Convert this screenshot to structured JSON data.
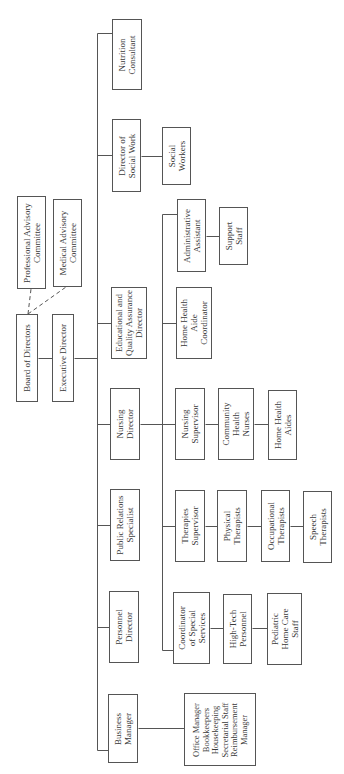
{
  "chart": {
    "orientation": "rotated-90-ccw",
    "nodes": [
      {
        "id": "professional",
        "label": "Professional Advisory\nCommittee",
        "x": 17,
        "y": 196,
        "w": 29,
        "h": 93
      },
      {
        "id": "medical",
        "label": "Medical Advisory\nCommittee",
        "x": 53,
        "y": 199,
        "w": 29,
        "h": 88
      },
      {
        "id": "board",
        "label": "Board of Directors",
        "x": 16,
        "y": 314,
        "w": 22,
        "h": 88
      },
      {
        "id": "executive",
        "label": "Executive Director",
        "x": 52,
        "y": 314,
        "w": 22,
        "h": 88
      },
      {
        "id": "nutrition",
        "label": "Nutrition\nConsultant",
        "x": 112,
        "y": 19,
        "w": 30,
        "h": 71
      },
      {
        "id": "social_director",
        "label": "Director of\nSocial Work",
        "x": 112,
        "y": 119,
        "w": 29,
        "h": 73
      },
      {
        "id": "social_workers",
        "label": "Social\nWorkers",
        "x": 162,
        "y": 127,
        "w": 29,
        "h": 58
      },
      {
        "id": "educational",
        "label": "Educational and\nQuality Assurance\nDirector",
        "x": 111,
        "y": 287,
        "w": 36,
        "h": 72
      },
      {
        "id": "admin_assistant",
        "label": "Administrative\nAssistant",
        "x": 177,
        "y": 199,
        "w": 29,
        "h": 73
      },
      {
        "id": "support_staff",
        "label": "Support\nStaff",
        "x": 219,
        "y": 207,
        "w": 29,
        "h": 58
      },
      {
        "id": "hha_coordinator",
        "label": "Home Health\nAide\nCoordinator",
        "x": 176,
        "y": 287,
        "w": 36,
        "h": 72
      },
      {
        "id": "nursing_director",
        "label": "Nursing\nDirector",
        "x": 110,
        "y": 388,
        "w": 30,
        "h": 72
      },
      {
        "id": "nursing_supervisor",
        "label": "Nursing\nSupervisor",
        "x": 175,
        "y": 388,
        "w": 30,
        "h": 72
      },
      {
        "id": "community_nurses",
        "label": "Community\nHealth\nNurses",
        "x": 218,
        "y": 388,
        "w": 36,
        "h": 72
      },
      {
        "id": "home_health_aides",
        "label": "Home Health\nAides",
        "x": 268,
        "y": 390,
        "w": 29,
        "h": 70
      },
      {
        "id": "public_relations",
        "label": "Public Relations\nSpecialist",
        "x": 110,
        "y": 489,
        "w": 30,
        "h": 72
      },
      {
        "id": "therapies_supervisor",
        "label": "Therapies\nSupervisor",
        "x": 175,
        "y": 490,
        "w": 30,
        "h": 72
      },
      {
        "id": "physical_therapists",
        "label": "Physical\nTherapists",
        "x": 217,
        "y": 490,
        "w": 30,
        "h": 72
      },
      {
        "id": "occupational_therapists",
        "label": "Occupational\nTherapists",
        "x": 261,
        "y": 490,
        "w": 29,
        "h": 72
      },
      {
        "id": "speech_therapists",
        "label": "Speech\nTherapists",
        "x": 303,
        "y": 491,
        "w": 29,
        "h": 72
      },
      {
        "id": "personnel_director",
        "label": "Personnel\nDirector",
        "x": 109,
        "y": 591,
        "w": 30,
        "h": 72
      },
      {
        "id": "special_services",
        "label": "Coordinator\nof Special\nServices",
        "x": 173,
        "y": 592,
        "w": 37,
        "h": 72
      },
      {
        "id": "high_tech",
        "label": "High-Tech\nPersonnel",
        "x": 223,
        "y": 594,
        "w": 29,
        "h": 70
      },
      {
        "id": "pediatric",
        "label": "Pediatric\nHome Care\nStaff",
        "x": 267,
        "y": 593,
        "w": 35,
        "h": 72
      },
      {
        "id": "business_manager",
        "label": "Business\nManager",
        "x": 108,
        "y": 694,
        "w": 30,
        "h": 69
      },
      {
        "id": "office_staff",
        "label": "Office Manager\nBookkeepers\nHousekeeping\nSecretarial Staff\nReimbursement\nManager",
        "x": 184,
        "y": 693,
        "w": 72,
        "h": 73
      }
    ],
    "solid_lines": [
      [
        38,
        358,
        52,
        358
      ],
      [
        74,
        358,
        97,
        358
      ],
      [
        97,
        33,
        97,
        750
      ],
      [
        97,
        33,
        112,
        33
      ],
      [
        97,
        155,
        112,
        155
      ],
      [
        141,
        156,
        162,
        156
      ],
      [
        97,
        323,
        111,
        323
      ],
      [
        97,
        424,
        110,
        424
      ],
      [
        97,
        525,
        110,
        525
      ],
      [
        97,
        627,
        109,
        627
      ],
      [
        97,
        750,
        108,
        750
      ],
      [
        138,
        728,
        184,
        728
      ],
      [
        140,
        424,
        162,
        424
      ],
      [
        162,
        214,
        162,
        650
      ],
      [
        162,
        214,
        177,
        214
      ],
      [
        206,
        236,
        219,
        236
      ],
      [
        162,
        323,
        176,
        323
      ],
      [
        162,
        424,
        175,
        424
      ],
      [
        205,
        424,
        218,
        424
      ],
      [
        254,
        424,
        268,
        424
      ],
      [
        162,
        526,
        175,
        526
      ],
      [
        205,
        526,
        217,
        526
      ],
      [
        247,
        526,
        261,
        526
      ],
      [
        290,
        526,
        303,
        526
      ],
      [
        162,
        650,
        173,
        650
      ],
      [
        210,
        628,
        223,
        628
      ],
      [
        252,
        628,
        267,
        628
      ]
    ],
    "dashed_lines": [
      [
        28,
        314,
        31,
        289
      ],
      [
        28,
        314,
        66,
        287
      ]
    ],
    "colors": {
      "line": "#555555",
      "text": "#3a3a3a",
      "background": "#ffffff"
    }
  }
}
